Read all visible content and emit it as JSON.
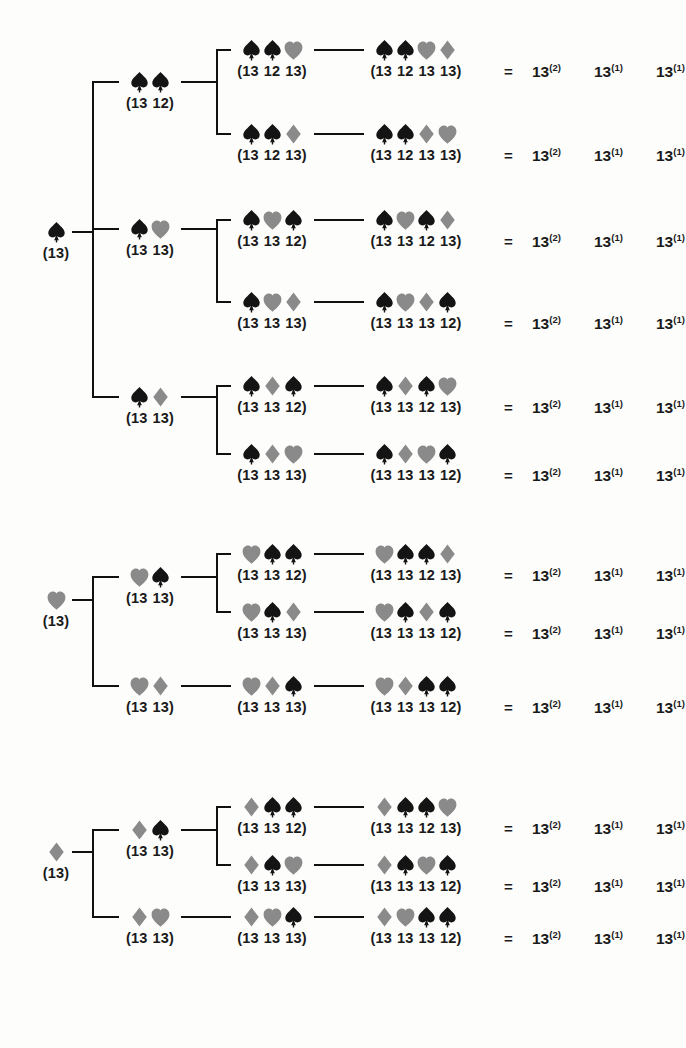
{
  "figure": {
    "type": "tree-diagram",
    "background": "#fdfdfb",
    "ink_black": "#141414",
    "ink_grey": "#8a8a8a",
    "equals_sign": "=",
    "power_base": "13",
    "power_terms": [
      "(2)",
      "(1)",
      "(1)"
    ]
  },
  "legend": {
    "suit_glyphs": {
      "spade": "spade-icon",
      "heart": "heart-icon",
      "diamond": "diamond-icon"
    },
    "suit_colors": {
      "spade": "#141414",
      "heart": "#8a8a8a",
      "diamond": "#8a8a8a"
    }
  },
  "groups": [
    {
      "id": "group-spade",
      "root": {
        "suits": [
          "spade"
        ],
        "label": [
          "(13)"
        ]
      },
      "level2": [
        {
          "suits": [
            "spade",
            "spade"
          ],
          "label": [
            "(13",
            "12)"
          ]
        },
        {
          "suits": [
            "spade",
            "heart"
          ],
          "label": [
            "(13",
            "13)"
          ]
        },
        {
          "suits": [
            "spade",
            "diamond"
          ],
          "label": [
            "(13",
            "13)"
          ]
        }
      ],
      "rows": [
        {
          "level3": {
            "suits": [
              "spade",
              "spade",
              "heart"
            ],
            "label": [
              "(13",
              "12",
              "13)"
            ]
          },
          "level4": {
            "suits": [
              "spade",
              "spade",
              "heart",
              "diamond"
            ],
            "label": [
              "(13",
              "12",
              "13",
              "13)"
            ]
          },
          "result": {
            "eq": "=",
            "terms": [
              {
                "base": "13",
                "exp": "(2)"
              },
              {
                "base": "13",
                "exp": "(1)"
              },
              {
                "base": "13",
                "exp": "(1)"
              }
            ]
          }
        },
        {
          "level3": {
            "suits": [
              "spade",
              "spade",
              "diamond"
            ],
            "label": [
              "(13",
              "12",
              "13)"
            ]
          },
          "level4": {
            "suits": [
              "spade",
              "spade",
              "diamond",
              "heart"
            ],
            "label": [
              "(13",
              "12",
              "13",
              "13)"
            ]
          },
          "result": {
            "eq": "=",
            "terms": [
              {
                "base": "13",
                "exp": "(2)"
              },
              {
                "base": "13",
                "exp": "(1)"
              },
              {
                "base": "13",
                "exp": "(1)"
              }
            ]
          }
        },
        {
          "level3": {
            "suits": [
              "spade",
              "heart",
              "spade"
            ],
            "label": [
              "(13",
              "13",
              "12)"
            ]
          },
          "level4": {
            "suits": [
              "spade",
              "heart",
              "spade",
              "diamond"
            ],
            "label": [
              "(13",
              "13",
              "12",
              "13)"
            ]
          },
          "result": {
            "eq": "=",
            "terms": [
              {
                "base": "13",
                "exp": "(2)"
              },
              {
                "base": "13",
                "exp": "(1)"
              },
              {
                "base": "13",
                "exp": "(1)"
              }
            ]
          }
        },
        {
          "level3": {
            "suits": [
              "spade",
              "heart",
              "diamond"
            ],
            "label": [
              "(13",
              "13",
              "13)"
            ]
          },
          "level4": {
            "suits": [
              "spade",
              "heart",
              "diamond",
              "spade"
            ],
            "label": [
              "(13",
              "13",
              "13",
              "12)"
            ]
          },
          "result": {
            "eq": "=",
            "terms": [
              {
                "base": "13",
                "exp": "(2)"
              },
              {
                "base": "13",
                "exp": "(1)"
              },
              {
                "base": "13",
                "exp": "(1)"
              }
            ]
          }
        },
        {
          "level3": {
            "suits": [
              "spade",
              "diamond",
              "spade"
            ],
            "label": [
              "(13",
              "13",
              "12)"
            ]
          },
          "level4": {
            "suits": [
              "spade",
              "diamond",
              "spade",
              "heart"
            ],
            "label": [
              "(13",
              "13",
              "12",
              "13)"
            ]
          },
          "result": {
            "eq": "=",
            "terms": [
              {
                "base": "13",
                "exp": "(2)"
              },
              {
                "base": "13",
                "exp": "(1)"
              },
              {
                "base": "13",
                "exp": "(1)"
              }
            ]
          }
        },
        {
          "level3": {
            "suits": [
              "spade",
              "diamond",
              "heart"
            ],
            "label": [
              "(13",
              "13",
              "13)"
            ]
          },
          "level4": {
            "suits": [
              "spade",
              "diamond",
              "heart",
              "spade"
            ],
            "label": [
              "(13",
              "13",
              "13",
              "12)"
            ]
          },
          "result": {
            "eq": "=",
            "terms": [
              {
                "base": "13",
                "exp": "(2)"
              },
              {
                "base": "13",
                "exp": "(1)"
              },
              {
                "base": "13",
                "exp": "(1)"
              }
            ]
          }
        }
      ]
    },
    {
      "id": "group-heart",
      "root": {
        "suits": [
          "heart"
        ],
        "label": [
          "(13)"
        ]
      },
      "level2": [
        {
          "suits": [
            "heart",
            "spade"
          ],
          "label": [
            "(13",
            "13)"
          ]
        },
        {
          "suits": [
            "heart",
            "diamond"
          ],
          "label": [
            "(13",
            "13)"
          ]
        }
      ],
      "rows": [
        {
          "level3": {
            "suits": [
              "heart",
              "spade",
              "spade"
            ],
            "label": [
              "(13",
              "13",
              "12)"
            ]
          },
          "level4": {
            "suits": [
              "heart",
              "spade",
              "spade",
              "diamond"
            ],
            "label": [
              "(13",
              "13",
              "12",
              "13)"
            ]
          },
          "result": {
            "eq": "=",
            "terms": [
              {
                "base": "13",
                "exp": "(2)"
              },
              {
                "base": "13",
                "exp": "(1)"
              },
              {
                "base": "13",
                "exp": "(1)"
              }
            ]
          }
        },
        {
          "level3": {
            "suits": [
              "heart",
              "spade",
              "diamond"
            ],
            "label": [
              "(13",
              "13",
              "13)"
            ]
          },
          "level4": {
            "suits": [
              "heart",
              "spade",
              "diamond",
              "spade"
            ],
            "label": [
              "(13",
              "13",
              "13",
              "12)"
            ]
          },
          "result": {
            "eq": "=",
            "terms": [
              {
                "base": "13",
                "exp": "(2)"
              },
              {
                "base": "13",
                "exp": "(1)"
              },
              {
                "base": "13",
                "exp": "(1)"
              }
            ]
          }
        },
        {
          "level3": {
            "suits": [
              "heart",
              "diamond",
              "spade"
            ],
            "label": [
              "(13",
              "13",
              "13)"
            ]
          },
          "level4": {
            "suits": [
              "heart",
              "diamond",
              "spade",
              "spade"
            ],
            "label": [
              "(13",
              "13",
              "13",
              "12)"
            ]
          },
          "result": {
            "eq": "=",
            "terms": [
              {
                "base": "13",
                "exp": "(2)"
              },
              {
                "base": "13",
                "exp": "(1)"
              },
              {
                "base": "13",
                "exp": "(1)"
              }
            ]
          }
        }
      ]
    },
    {
      "id": "group-diamond",
      "root": {
        "suits": [
          "diamond"
        ],
        "label": [
          "(13)"
        ]
      },
      "level2": [
        {
          "suits": [
            "diamond",
            "spade"
          ],
          "label": [
            "(13",
            "13)"
          ]
        },
        {
          "suits": [
            "diamond",
            "heart"
          ],
          "label": [
            "(13",
            "13)"
          ]
        }
      ],
      "rows": [
        {
          "level3": {
            "suits": [
              "diamond",
              "spade",
              "spade"
            ],
            "label": [
              "(13",
              "13",
              "12)"
            ]
          },
          "level4": {
            "suits": [
              "diamond",
              "spade",
              "spade",
              "heart"
            ],
            "label": [
              "(13",
              "13",
              "12",
              "13)"
            ]
          },
          "result": {
            "eq": "=",
            "terms": [
              {
                "base": "13",
                "exp": "(2)"
              },
              {
                "base": "13",
                "exp": "(1)"
              },
              {
                "base": "13",
                "exp": "(1)"
              }
            ]
          }
        },
        {
          "level3": {
            "suits": [
              "diamond",
              "spade",
              "heart"
            ],
            "label": [
              "(13",
              "13",
              "13)"
            ]
          },
          "level4": {
            "suits": [
              "diamond",
              "spade",
              "heart",
              "spade"
            ],
            "label": [
              "(13",
              "13",
              "13",
              "12)"
            ]
          },
          "result": {
            "eq": "=",
            "terms": [
              {
                "base": "13",
                "exp": "(2)"
              },
              {
                "base": "13",
                "exp": "(1)"
              },
              {
                "base": "13",
                "exp": "(1)"
              }
            ]
          }
        },
        {
          "level3": {
            "suits": [
              "diamond",
              "heart",
              "spade"
            ],
            "label": [
              "(13",
              "13",
              "13)"
            ]
          },
          "level4": {
            "suits": [
              "diamond",
              "heart",
              "spade",
              "spade"
            ],
            "label": [
              "(13",
              "13",
              "13",
              "12)"
            ]
          },
          "result": {
            "eq": "=",
            "terms": [
              {
                "base": "13",
                "exp": "(2)"
              },
              {
                "base": "13",
                "exp": "(1)"
              },
              {
                "base": "13",
                "exp": "(1)"
              }
            ]
          }
        }
      ]
    }
  ]
}
